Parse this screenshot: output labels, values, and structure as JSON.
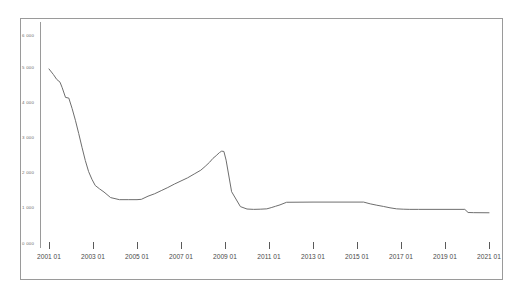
{
  "chart": {
    "title": "",
    "subtitle": "",
    "type": "line"
  },
  "axis": {
    "x_label": "",
    "y_label": ""
  },
  "chart_data": {
    "type": "line",
    "title": "",
    "subtitle": "",
    "xlabel": "",
    "ylabel": "",
    "grid": false,
    "legend": "none",
    "xlim": [
      "2001 01",
      "2021 01"
    ],
    "ylim": [
      0,
      6000
    ],
    "ytick_labels": [
      "6 000",
      "5 000",
      "4 000",
      "3 000",
      "2 000",
      "1 000",
      "0 000"
    ],
    "ytick_values": [
      6000,
      5000,
      4000,
      3000,
      2000,
      1000,
      0
    ],
    "xtick_labels": [
      "2001 01",
      "2003 01",
      "2005 01",
      "2007 01",
      "2009 01",
      "2011 01",
      "2013 01",
      "2015 01",
      "2017 01",
      "2019 01",
      "2021 01"
    ],
    "xtick_values": [
      2001.0,
      2003.0,
      2005.0,
      2007.0,
      2009.0,
      2011.0,
      2013.0,
      2015.0,
      2017.0,
      2019.0,
      2021.0
    ],
    "series": [
      {
        "name": "series-1",
        "color": "#6e6e6e",
        "x": [
          2001.0,
          2001.2,
          2001.35,
          2001.5,
          2001.6,
          2001.75,
          2001.9,
          2002.05,
          2002.2,
          2002.35,
          2002.5,
          2002.65,
          2002.8,
          2002.95,
          2003.1,
          2003.3,
          2003.5,
          2003.8,
          2004.2,
          2004.6,
          2005.0,
          2005.2,
          2005.5,
          2005.8,
          2006.1,
          2006.4,
          2006.7,
          2007.0,
          2007.3,
          2007.6,
          2007.9,
          2008.1,
          2008.3,
          2008.45,
          2008.6,
          2008.75,
          2008.85,
          2008.95,
          2009.05,
          2009.3,
          2009.7,
          2010.0,
          2010.3,
          2010.6,
          2010.9,
          2011.1,
          2011.3,
          2011.5,
          2011.8,
          2013.0,
          2014.5,
          2015.3,
          2015.6,
          2015.9,
          2016.2,
          2016.5,
          2016.8,
          2017.1,
          2017.4,
          2017.8,
          2019.0,
          2019.9,
          2020.05,
          2020.3,
          2021.0
        ],
        "y": [
          5020,
          4860,
          4720,
          4640,
          4480,
          4200,
          4180,
          3880,
          3540,
          3160,
          2760,
          2380,
          2060,
          1840,
          1660,
          1560,
          1470,
          1310,
          1250,
          1250,
          1250,
          1260,
          1350,
          1420,
          1510,
          1600,
          1700,
          1790,
          1880,
          1990,
          2100,
          2210,
          2330,
          2440,
          2520,
          2610,
          2650,
          2640,
          2390,
          1480,
          1050,
          980,
          970,
          975,
          985,
          1020,
          1060,
          1100,
          1175,
          1180,
          1180,
          1180,
          1130,
          1090,
          1055,
          1015,
          985,
          975,
          970,
          970,
          970,
          970,
          880,
          875,
          872
        ]
      }
    ]
  }
}
